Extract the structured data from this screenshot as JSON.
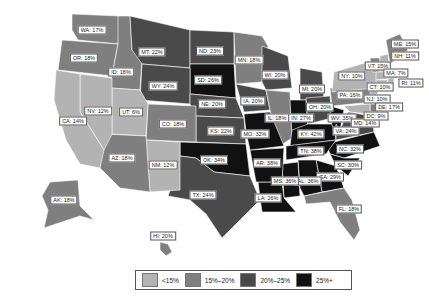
{
  "colors": {
    "lt15": "#b3b3b3",
    "15to20": "#7f7f7f",
    "20to25": "#4a4a4a",
    "25plus": "#111111"
  },
  "legend": [
    {
      "label": "<15%",
      "color": "#b3b3b3"
    },
    {
      "label": "15%–20%",
      "color": "#7f7f7f"
    },
    {
      "label": "20%–25%",
      "color": "#4a4a4a"
    },
    {
      "label": "25%+",
      "color": "#111111"
    }
  ],
  "states": [
    {
      "code": "WA",
      "label": "WA: 17%",
      "value": 17,
      "x": 92,
      "y": 30
    },
    {
      "code": "OR",
      "label": "OR: 18%",
      "value": 18,
      "x": 84,
      "y": 58
    },
    {
      "code": "ID",
      "label": "ID: 18%",
      "value": 18,
      "x": 121,
      "y": 72
    },
    {
      "code": "MT",
      "label": "MT: 22%",
      "value": 22,
      "x": 152,
      "y": 52
    },
    {
      "code": "ND",
      "label": "ND: 23%",
      "value": 23,
      "x": 210,
      "y": 51
    },
    {
      "code": "MN",
      "label": "MN: 18%",
      "value": 18,
      "x": 249,
      "y": 60
    },
    {
      "code": "WI",
      "label": "WI: 20%",
      "value": 20,
      "x": 275,
      "y": 75
    },
    {
      "code": "SD",
      "label": "SD: 26%",
      "value": 26,
      "x": 208,
      "y": 80
    },
    {
      "code": "WY",
      "label": "WY: 24%",
      "value": 24,
      "x": 163,
      "y": 86
    },
    {
      "code": "NE",
      "label": "NE: 20%",
      "value": 20,
      "x": 212,
      "y": 104
    },
    {
      "code": "IA",
      "label": "IA: 20%",
      "value": 20,
      "x": 253,
      "y": 101
    },
    {
      "code": "NV",
      "label": "NV: 12%",
      "value": 12,
      "x": 98,
      "y": 111
    },
    {
      "code": "UT",
      "label": "UT: 6%",
      "value": 6,
      "x": 131,
      "y": 112
    },
    {
      "code": "CA",
      "label": "CA: 14%",
      "value": 14,
      "x": 73,
      "y": 121
    },
    {
      "code": "CO",
      "label": "CO: 18%",
      "value": 18,
      "x": 173,
      "y": 124
    },
    {
      "code": "KS",
      "label": "KS: 22%",
      "value": 22,
      "x": 221,
      "y": 131
    },
    {
      "code": "MO",
      "label": "MO: 32%",
      "value": 32,
      "x": 255,
      "y": 134
    },
    {
      "code": "IL",
      "label": "IL: 18%",
      "value": 18,
      "x": 277,
      "y": 118
    },
    {
      "code": "IN",
      "label": "IN: 27%",
      "value": 27,
      "x": 301,
      "y": 118
    },
    {
      "code": "MI",
      "label": "MI: 20%",
      "value": 20,
      "x": 312,
      "y": 89
    },
    {
      "code": "OH",
      "label": "OH: 20%",
      "value": 20,
      "x": 320,
      "y": 107
    },
    {
      "code": "KY",
      "label": "KY: 42%",
      "value": 42,
      "x": 311,
      "y": 134
    },
    {
      "code": "WV",
      "label": "WV: 35%",
      "value": 35,
      "x": 342,
      "y": 118
    },
    {
      "code": "VA",
      "label": "VA: 24%",
      "value": 24,
      "x": 346,
      "y": 131
    },
    {
      "code": "MD",
      "label": "MD: 14%",
      "value": 14,
      "x": 365,
      "y": 123
    },
    {
      "code": "TN",
      "label": "TN: 38%",
      "value": 38,
      "x": 311,
      "y": 151
    },
    {
      "code": "NC",
      "label": "NC: 32%",
      "value": 32,
      "x": 350,
      "y": 149
    },
    {
      "code": "SC",
      "label": "SC: 30%",
      "value": 30,
      "x": 348,
      "y": 165
    },
    {
      "code": "GA",
      "label": "GA: 29%",
      "value": 29,
      "x": 330,
      "y": 177
    },
    {
      "code": "AL",
      "label": "AL: 36%",
      "value": 36,
      "x": 308,
      "y": 181
    },
    {
      "code": "MS",
      "label": "MS: 36%",
      "value": 36,
      "x": 285,
      "y": 181
    },
    {
      "code": "AR",
      "label": "AR: 38%",
      "value": 38,
      "x": 267,
      "y": 163
    },
    {
      "code": "LA",
      "label": "LA: 26%",
      "value": 26,
      "x": 268,
      "y": 198
    },
    {
      "code": "OK",
      "label": "OK: 34%",
      "value": 34,
      "x": 214,
      "y": 160
    },
    {
      "code": "TX",
      "label": "TX: 24%",
      "value": 24,
      "x": 203,
      "y": 195
    },
    {
      "code": "NM",
      "label": "NM: 12%",
      "value": 12,
      "x": 163,
      "y": 165
    },
    {
      "code": "AZ",
      "label": "AZ: 18%",
      "value": 18,
      "x": 122,
      "y": 158
    },
    {
      "code": "FL",
      "label": "FL: 18%",
      "value": 18,
      "x": 349,
      "y": 209
    },
    {
      "code": "AK",
      "label": "AK: 18%",
      "value": 18,
      "x": 64,
      "y": 200
    },
    {
      "code": "HI",
      "label": "HI: 20%",
      "value": 20,
      "x": 163,
      "y": 236
    },
    {
      "code": "PA",
      "label": "PA: 16%",
      "value": 16,
      "x": 350,
      "y": 95
    },
    {
      "code": "NY",
      "label": "NY: 10%",
      "value": 10,
      "x": 352,
      "y": 76
    },
    {
      "code": "ME",
      "label": "ME: 15%",
      "value": 15,
      "x": 405,
      "y": 44
    },
    {
      "code": "NH",
      "label": "NH: 11%",
      "value": 11,
      "x": 405,
      "y": 56
    },
    {
      "code": "VT",
      "label": "VT: 15%",
      "value": 15,
      "x": 378,
      "y": 66
    },
    {
      "code": "MA",
      "label": "MA: 7%",
      "value": 7,
      "x": 396,
      "y": 73
    },
    {
      "code": "RI",
      "label": "RI: 11%",
      "value": 11,
      "x": 411,
      "y": 83
    },
    {
      "code": "CT",
      "label": "CT: 10%",
      "value": 10,
      "x": 380,
      "y": 87
    },
    {
      "code": "NJ",
      "label": "NJ: 10%",
      "value": 10,
      "x": 377,
      "y": 99
    },
    {
      "code": "DE",
      "label": "DE: 17%",
      "value": 17,
      "x": 389,
      "y": 107
    },
    {
      "code": "DC",
      "label": "DC: 9%",
      "value": 9,
      "x": 376,
      "y": 116
    }
  ]
}
